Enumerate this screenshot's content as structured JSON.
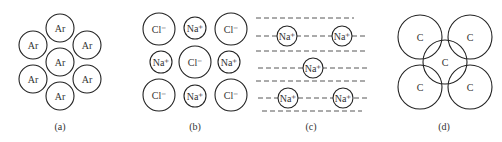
{
  "panels": [
    {
      "caption": "(a)",
      "description": "Argon atoms, close-packed",
      "atoms": [
        {
          "label": "Ar",
          "cx": 60,
          "cy": 28,
          "r": 14
        },
        {
          "label": "Ar",
          "cx": 33,
          "cy": 45,
          "r": 14
        },
        {
          "label": "Ar",
          "cx": 87,
          "cy": 45,
          "r": 14
        },
        {
          "label": "Ar",
          "cx": 60,
          "cy": 62,
          "r": 14
        },
        {
          "label": "Ar",
          "cx": 33,
          "cy": 79,
          "r": 14
        },
        {
          "label": "Ar",
          "cx": 87,
          "cy": 79,
          "r": 14
        },
        {
          "label": "Ar",
          "cx": 60,
          "cy": 96,
          "r": 14
        }
      ]
    },
    {
      "caption": "(b)",
      "description": "Sodium chloride ionic lattice",
      "atoms": [
        {
          "label": "Cl⁻",
          "cx": 159,
          "cy": 29,
          "r": 16
        },
        {
          "label": "Na⁺",
          "cx": 195,
          "cy": 28,
          "r": 11
        },
        {
          "label": "Cl⁻",
          "cx": 231,
          "cy": 29,
          "r": 16
        },
        {
          "label": "Na⁺",
          "cx": 161,
          "cy": 62,
          "r": 11
        },
        {
          "label": "Cl⁻",
          "cx": 195,
          "cy": 62,
          "r": 16
        },
        {
          "label": "Na⁺",
          "cx": 229,
          "cy": 62,
          "r": 11
        },
        {
          "label": "Cl⁻",
          "cx": 159,
          "cy": 95,
          "r": 16
        },
        {
          "label": "Na⁺",
          "cx": 195,
          "cy": 96,
          "r": 11
        },
        {
          "label": "Cl⁻",
          "cx": 231,
          "cy": 95,
          "r": 16
        }
      ]
    },
    {
      "caption": "(c)",
      "description": "Sodium metal ions in electron sea",
      "atoms": [
        {
          "label": "Na⁺",
          "cx": 287,
          "cy": 36,
          "r": 10
        },
        {
          "label": "Na⁺",
          "cx": 342,
          "cy": 36,
          "r": 10
        },
        {
          "label": "Na⁺",
          "cx": 313,
          "cy": 68,
          "r": 10
        },
        {
          "label": "Na⁺",
          "cx": 288,
          "cy": 98,
          "r": 10
        },
        {
          "label": "Na⁺",
          "cx": 343,
          "cy": 98,
          "r": 10
        }
      ],
      "dashed_lines": [
        {
          "x1": 256,
          "x2": 354,
          "y": 18
        },
        {
          "x1": 256,
          "x2": 368,
          "y": 36
        },
        {
          "x1": 256,
          "x2": 368,
          "y": 51
        },
        {
          "x1": 258,
          "x2": 368,
          "y": 68
        },
        {
          "x1": 256,
          "x2": 366,
          "y": 81
        },
        {
          "x1": 258,
          "x2": 368,
          "y": 98
        },
        {
          "x1": 262,
          "x2": 362,
          "y": 111
        }
      ]
    },
    {
      "caption": "(d)",
      "description": "Carbon atoms, covalent network",
      "atoms": [
        {
          "label": "C",
          "cx": 420,
          "cy": 37,
          "r": 22
        },
        {
          "label": "C",
          "cx": 470,
          "cy": 37,
          "r": 22
        },
        {
          "label": "C",
          "cx": 445,
          "cy": 62,
          "r": 22
        },
        {
          "label": "C",
          "cx": 420,
          "cy": 87,
          "r": 22
        },
        {
          "label": "C",
          "cx": 470,
          "cy": 87,
          "r": 22
        }
      ]
    }
  ],
  "captions_y": 130,
  "caption_x": [
    60,
    195,
    311,
    444
  ]
}
